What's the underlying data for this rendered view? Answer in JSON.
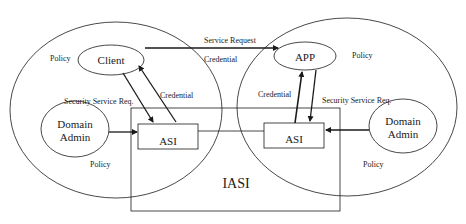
{
  "diagram": {
    "type": "architecture",
    "domains": [
      {
        "id": "client-domain",
        "policy_labels": [
          "Policy",
          "Policy"
        ],
        "nodes": {
          "principal": "Client",
          "admin": "Domain Admin",
          "admin_line1": "Domain",
          "admin_line2": "Admin",
          "asi": "ASI"
        },
        "edge_labels": {
          "security_request": "Security Service Req.",
          "credential": "Credential"
        }
      },
      {
        "id": "app-domain",
        "policy_labels": [
          "Policy",
          "Policy"
        ],
        "nodes": {
          "principal": "APP",
          "admin": "Domain Admin",
          "admin_line1": "Domain",
          "admin_line2": "Admin",
          "asi": "ASI"
        },
        "edge_labels": {
          "security_request": "Security Service Req.",
          "credential": "Credential"
        }
      }
    ],
    "shared": {
      "iasi": "IASI",
      "service_request": "Service Request",
      "credential": "Credential"
    },
    "edges": [
      {
        "from": "Client",
        "to": "APP",
        "label": "Service Request"
      },
      {
        "from": "Client",
        "to": "ASI (left)",
        "label": "Security Service Req."
      },
      {
        "from": "ASI (left)",
        "to": "Client",
        "label": "Credential"
      },
      {
        "from": "Domain Admin (left)",
        "to": "ASI (left)",
        "label": ""
      },
      {
        "from": "ASI (left)",
        "to": "ASI (right)",
        "label": ""
      },
      {
        "from": "ASI (right)",
        "to": "APP",
        "label": "Credential"
      },
      {
        "from": "APP",
        "to": "ASI (right)",
        "label": "Security Service Req."
      },
      {
        "from": "Domain Admin (right)",
        "to": "ASI (right)",
        "label": ""
      }
    ],
    "colors": {
      "stroke": "#1a1a1a",
      "background": "#ffffff"
    }
  }
}
